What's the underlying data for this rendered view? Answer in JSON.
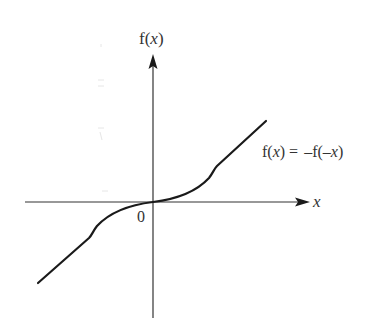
{
  "diagram": {
    "type": "odd-function-graph",
    "y_axis_label_prefix": "f(",
    "y_axis_label_var": "x",
    "y_axis_label_suffix": ")",
    "x_axis_label": "x",
    "origin_label": "0",
    "equation": {
      "lhs_prefix": "f(",
      "lhs_var": "x",
      "lhs_suffix": ") =",
      "rhs_prefix": "–f(–",
      "rhs_var": "x",
      "rhs_suffix": ")"
    },
    "colors": {
      "axis": "#333333",
      "curve": "#1a1a1a",
      "text": "#333333"
    }
  }
}
